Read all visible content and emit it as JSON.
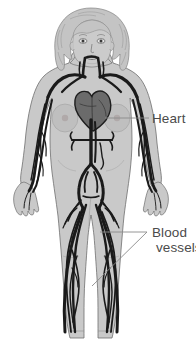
{
  "figure": {
    "name": "human-circulatory-system-diagram",
    "background_color": "#ffffff"
  },
  "labels": {
    "heart": {
      "text": "Heart",
      "color": "#4b4b4b"
    },
    "blood_vessels": {
      "line1": "Blood",
      "line2": "vessels",
      "color": "#4b4b4b"
    }
  },
  "colors": {
    "background": "#ffffff",
    "body_fill": "#c9c9c9",
    "body_outline": "#6e6e6e",
    "hair_fill": "#c2c2c2",
    "hair_outline": "#777777",
    "vessel": "#1a1a1a",
    "heart_fill": "#6b6b6b",
    "heart_outline": "#242424",
    "leader_line": "#8a8a8a",
    "label_text": "#4b4b4b",
    "breast_shade": "#bdbdbd"
  },
  "anatomy_parts": [
    "head",
    "hair",
    "face",
    "neck",
    "torso",
    "breasts",
    "arms",
    "hands",
    "pelvis",
    "thighs",
    "lower-legs",
    "heart",
    "aorta",
    "vena-cava",
    "carotid-arteries",
    "subclavian-arteries",
    "renal-arteries",
    "iliac-arteries",
    "femoral-vessels",
    "leg-vessels",
    "arm-vessels"
  ],
  "leaders": {
    "heart": {
      "from_x": 105,
      "from_y": 118,
      "to_x": 148,
      "to_y": 118
    },
    "blood_vessels_upper": {
      "from_x": 100,
      "from_y": 232,
      "to_x": 147,
      "to_y": 232
    },
    "blood_vessels_lower": {
      "from_x": 92,
      "from_y": 285,
      "to_x": 147,
      "to_y": 232
    }
  }
}
